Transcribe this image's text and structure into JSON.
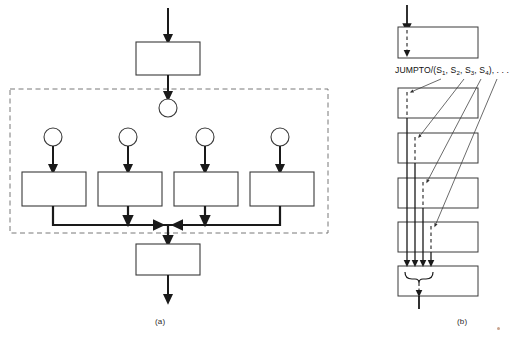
{
  "figure": {
    "background_color": "#ffffff",
    "line_color": "#1a1a1a",
    "dashed_color": "#555555",
    "thin_line_color": "#444444"
  },
  "panel_a": {
    "caption": "(a)",
    "description": "Fork-join parallel process diagram enclosed in a dashed region",
    "top_box": {
      "label": "",
      "x": 136,
      "y": 42,
      "w": 64,
      "h": 33
    },
    "bottom_box": {
      "label": "",
      "x": 136,
      "y": 244,
      "w": 64,
      "h": 31
    },
    "fork_node": {
      "label": "",
      "cx": 168,
      "cy": 108,
      "r": 9
    },
    "branch_nodes": [
      {
        "label": "",
        "cx": 53,
        "cy": 137,
        "r": 9
      },
      {
        "label": "",
        "cx": 128,
        "cy": 137,
        "r": 9
      },
      {
        "label": "",
        "cx": 205,
        "cy": 137,
        "r": 9
      },
      {
        "label": "",
        "cx": 280,
        "cy": 137,
        "r": 9
      }
    ],
    "branch_boxes": [
      {
        "label": "",
        "x": 22,
        "y": 172,
        "w": 64,
        "h": 34
      },
      {
        "label": "",
        "x": 98,
        "y": 172,
        "w": 64,
        "h": 34
      },
      {
        "label": "",
        "x": 174,
        "y": 172,
        "w": 64,
        "h": 34
      },
      {
        "label": "",
        "x": 250,
        "y": 172,
        "w": 64,
        "h": 34
      }
    ],
    "dashed_region": {
      "x": 10,
      "y": 89,
      "w": 318,
      "h": 144
    },
    "join_bus_y": 225
  },
  "panel_b": {
    "caption": "(b)",
    "description": "Linear sequence of instruction blocks with JUMPTO leader lines and a join brace",
    "label": {
      "prefix": "JUMPTO/(S",
      "sub1": "1",
      "sep1": ", S",
      "sub2": "2",
      "sep2": ", S",
      "sub3": "3",
      "sep3": ", S",
      "sub4": "4",
      "suffix": "), . . ."
    },
    "label_text": "JUMPTO/(S1, S2, S3, S4), . . .",
    "boxes": [
      {
        "label": "",
        "x": 398,
        "y": 27,
        "w": 80,
        "h": 31
      },
      {
        "label": "",
        "x": 398,
        "y": 88,
        "w": 80,
        "h": 30
      },
      {
        "label": "",
        "x": 398,
        "y": 133,
        "w": 80,
        "h": 30
      },
      {
        "label": "",
        "x": 398,
        "y": 178,
        "w": 80,
        "h": 30
      },
      {
        "label": "",
        "x": 398,
        "y": 222,
        "w": 80,
        "h": 30
      },
      {
        "label": "",
        "x": 398,
        "y": 266,
        "w": 80,
        "h": 30
      }
    ],
    "drop_lines_x": [
      407,
      415,
      423,
      431
    ],
    "leader_targets": [
      407,
      415,
      423,
      431
    ],
    "join_brace_y": 277
  }
}
